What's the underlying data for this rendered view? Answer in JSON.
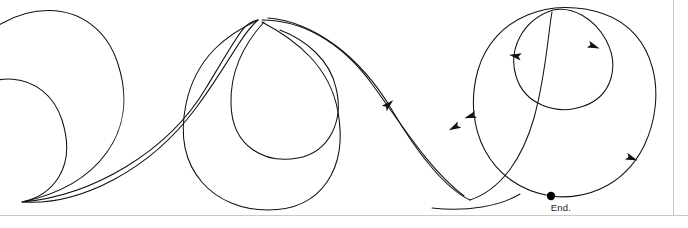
{
  "figure": {
    "background_color": "#ffffff",
    "stroke_color": "#111111",
    "frame_color": "#c8c8c8",
    "width": 688,
    "height": 228,
    "annotations": [
      {
        "id": "end-marker",
        "label": "End.",
        "label_x": 561,
        "label_y": 211,
        "dot_x": 551,
        "dot_y": 196,
        "dot_radius": 4.2
      }
    ]
  },
  "chart_data": {
    "type": "line",
    "xlabel": "",
    "ylabel": "",
    "grid": false,
    "legend": null,
    "xlim": [
      0,
      688
    ],
    "ylim": [
      0,
      228
    ],
    "annotations": [
      {
        "text": "End.",
        "x": 561,
        "y": 211
      }
    ],
    "markers": [
      {
        "name": "end-point",
        "x": 551,
        "y": 196,
        "style": "filled-circle"
      }
    ],
    "series": [
      {
        "name": "outer-sweep-upper",
        "path": "M -40,62 C 10,-8 96,-6 118,64 C 140,132 98,186 22,202 C 92,196 168,152 206,88 C 240,32 244,22 258,20"
      },
      {
        "name": "outer-sweep-lower",
        "path": "M -48,112 C -16,64 46,70 62,120 C 78,170 50,196 22,202 C 80,206 150,170 196,108 C 230,62 240,36 258,20"
      },
      {
        "name": "mid-loop-outer",
        "path": "M 258,20 C 228,34 196,56 186,104 C 172,172 216,210 268,210 C 322,210 348,168 338,112 C 330,66 296,40 262,22"
      },
      {
        "name": "mid-loop-inner",
        "path": "M 264,22 C 244,44 230,72 231,104 C 232,148 266,164 298,158 C 330,152 344,120 336,88 C 330,60 306,40 280,30"
      },
      {
        "name": "upper-right-sweep",
        "path": "M 262,20 C 300,20 340,40 372,84 C 404,128 430,170 464,196"
      },
      {
        "name": "right-descend-a",
        "path": "M 268,18 C 314,22 360,56 392,110 C 420,158 448,190 470,200"
      },
      {
        "name": "bottom-tail",
        "path": "M 432,208 C 468,212 500,206 520,194"
      },
      {
        "name": "right-big-loop",
        "path": "M 551,196 C 488,186 462,126 478,70 C 494,16 552,-4 604,14 C 656,32 668,96 644,146 C 622,190 580,200 551,196"
      },
      {
        "name": "right-inner-loop",
        "path": "M 553,10 C 522,20 508,50 516,76 C 524,104 556,116 584,106 C 612,96 620,66 606,40 C 594,18 572,6 553,10"
      },
      {
        "name": "right-entry-curve",
        "path": "M 470,200 C 500,190 522,160 534,118 C 546,74 548,34 552,12"
      }
    ],
    "arrows": [
      {
        "name": "arrow-upleft-mid",
        "x": 388,
        "y": 105,
        "angle": 228
      },
      {
        "name": "arrow-downright-a",
        "x": 455,
        "y": 127,
        "angle": 62
      },
      {
        "name": "arrow-downright-b",
        "x": 471,
        "y": 116,
        "angle": 72
      },
      {
        "name": "arrow-inner-left",
        "x": 516,
        "y": 56,
        "angle": 100
      },
      {
        "name": "arrow-inner-right",
        "x": 593,
        "y": 46,
        "angle": 290
      },
      {
        "name": "arrow-outer-right",
        "x": 631,
        "y": 158,
        "angle": 290
      }
    ]
  }
}
